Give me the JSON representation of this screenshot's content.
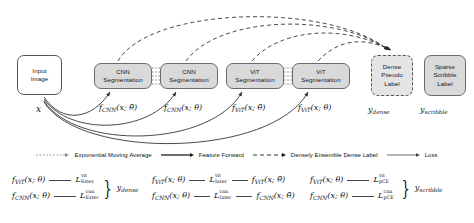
{
  "diagram": {
    "nodes": {
      "input_image": {
        "line1": "Input",
        "line2": "Image"
      },
      "cnn_teacher": {
        "line1": "CNN",
        "line2": "Segmentation"
      },
      "cnn_student": {
        "line1": "CNN",
        "line2": "Segmentation"
      },
      "vit_teacher": {
        "line1": "ViT",
        "line2": "Segmentation"
      },
      "vit_student": {
        "line1": "ViT",
        "line2": "Segmentation"
      },
      "dense_pseudo_label": {
        "line1": "Dense",
        "line2": "Pseudo",
        "line3": "Label"
      },
      "sparse_scribble_label": {
        "line1": "Sparse",
        "line2": "Scribble",
        "line3": "Label"
      }
    },
    "edge_labels": {
      "input": "x",
      "cnn_teacher": "f",
      "cnn_teacher_sub": "CNN",
      "cnn_teacher_arg": "(x; θ̄)",
      "cnn_student": "f",
      "cnn_student_sub": "CNN",
      "cnn_student_arg": "(x; θ)",
      "vit_teacher": "f",
      "vit_teacher_sub": "ViT",
      "vit_teacher_arg": "(x; θ̄)",
      "vit_student": "f",
      "vit_student_sub": "ViT",
      "vit_student_arg": "(x; θ)",
      "y_dense": "y",
      "y_dense_sub": "dense",
      "y_scribble": "y",
      "y_scribble_sub": "scribble"
    }
  },
  "legend": {
    "items": [
      {
        "label": "Exponential Moving Average",
        "style": "dotted"
      },
      {
        "label": "Feature Forward",
        "style": "solid"
      },
      {
        "label": "Densely Ensemble Dense Label",
        "style": "dashed"
      },
      {
        "label": "Loss",
        "style": "thin-solid"
      }
    ]
  },
  "equations": {
    "groups": [
      {
        "name": "exterior",
        "rows": [
          {
            "fn": "f",
            "fn_sub": "ViT",
            "fn_arg": "(x; θ)",
            "loss": "L",
            "loss_sup": "vit",
            "loss_sub": "Exter"
          },
          {
            "fn": "f",
            "fn_sub": "CNN",
            "fn_arg": "(x; θ)",
            "loss": "L",
            "loss_sup": "cnn",
            "loss_sub": "Exter"
          }
        ],
        "target": "y",
        "target_sub": "dense"
      },
      {
        "name": "interior",
        "rows": [
          {
            "fn": "f",
            "fn_sub": "ViT",
            "fn_arg": "(x; θ)",
            "loss": "L",
            "loss_sup": "vit",
            "loss_sub": "Inter",
            "rhs": "f",
            "rhs_sub": "ViT",
            "rhs_arg": "(x; θ̄)"
          },
          {
            "fn": "f",
            "fn_sub": "CNN",
            "fn_arg": "(x; θ)",
            "loss": "L",
            "loss_sup": "cnn",
            "loss_sub": "Inter",
            "rhs": "f",
            "rhs_sub": "CNN",
            "rhs_arg": "(x; θ̄)"
          }
        ],
        "target": "",
        "target_sub": ""
      },
      {
        "name": "partial-cross-entropy",
        "rows": [
          {
            "fn": "f",
            "fn_sub": "ViT",
            "fn_arg": "(x; θ)",
            "loss": "L",
            "loss_sup": "vit",
            "loss_sub": "pCE"
          },
          {
            "fn": "f",
            "fn_sub": "CNN",
            "fn_arg": "(x; θ)",
            "loss": "L",
            "loss_sup": "cnn",
            "loss_sub": "pCE"
          }
        ],
        "target": "y",
        "target_sub": "scribble"
      }
    ]
  },
  "colors": {
    "box_fill": "#d9d9d9",
    "box_stroke": "#6a6a6a",
    "line": "#2b2b2b",
    "background": "#ffffff"
  }
}
